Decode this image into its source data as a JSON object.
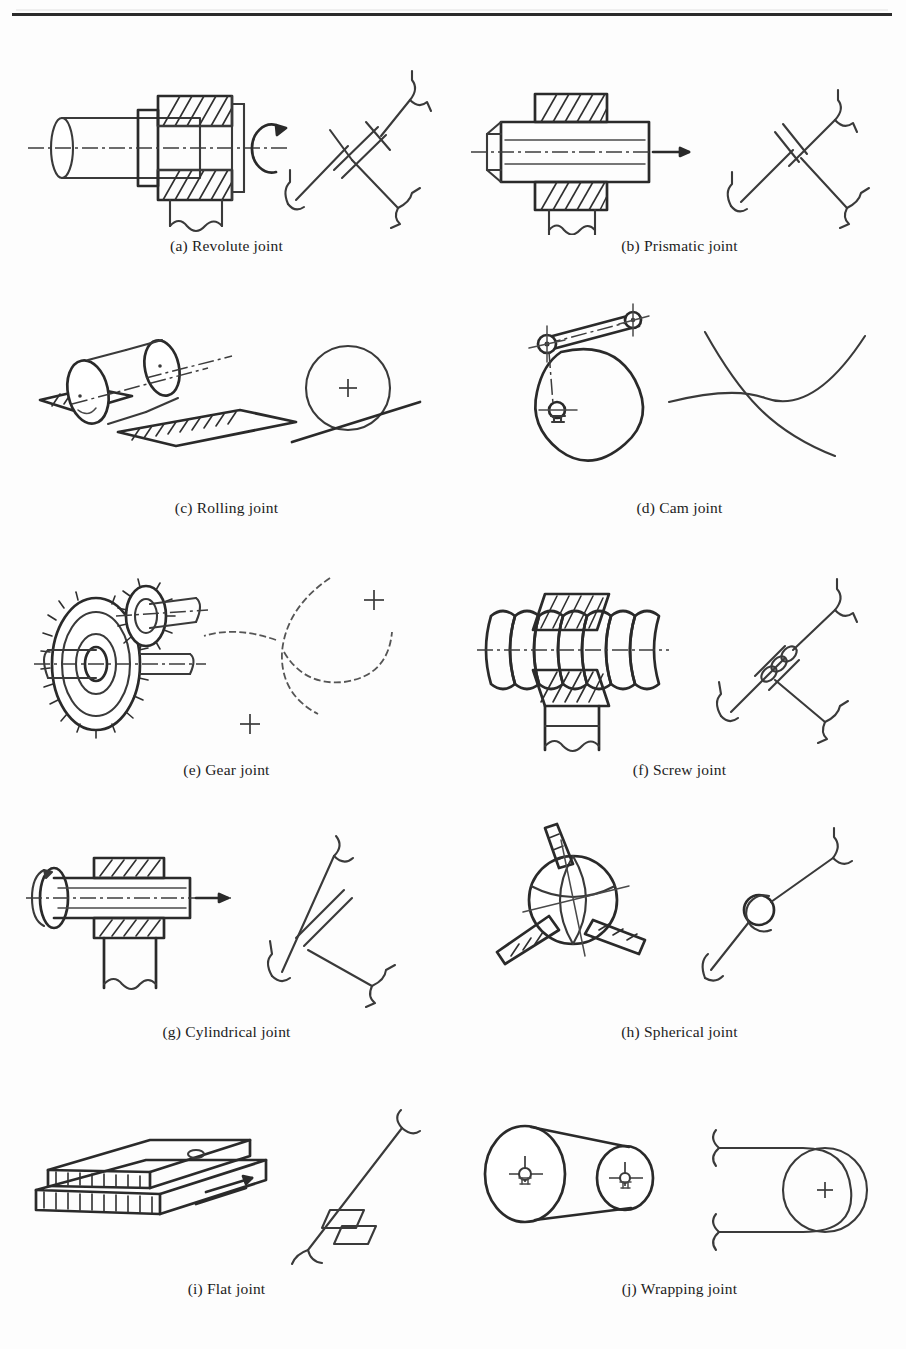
{
  "figure": {
    "has_top_rule": true,
    "column_count": 2,
    "row_count": 5,
    "ink_color": "#3a3a3a",
    "background_color": "#fdfdfd"
  },
  "items": [
    {
      "key": "a",
      "label": "(a) Revolute joint",
      "letter": "(a)",
      "name": "Revolute joint",
      "pictorial": "shaft-in-hatched-bearing-block-with-rotation-arrow",
      "symbol": "two-links-with-pin-joint-and-cross-hatch-ground-hooks",
      "dof": "1 rotational"
    },
    {
      "key": "b",
      "label": "(b) Prismatic joint",
      "letter": "(b)",
      "name": "Prismatic joint",
      "pictorial": "square-slider-bar-through-hatched-guide-block-with-translation-arrow",
      "symbol": "two-links-with-sliding-pair-and-ground-hooks",
      "dof": "1 translational"
    },
    {
      "key": "c",
      "label": "(c) Rolling joint",
      "letter": "(c)",
      "name": "Rolling joint",
      "pictorial": "roller-wheels-on-hatched-flat-rails",
      "symbol": "circle-tangent-to-inclined-line-with-center-cross",
      "dof": "rolling contact"
    },
    {
      "key": "d",
      "label": "(d) Cam joint",
      "letter": "(d)",
      "name": "Cam joint",
      "pictorial": "cam-disc-with-pivoted-follower-arm-and-center-marks",
      "symbol": "two-tangent-curves-higher-pair-contact",
      "dof": "higher pair contact"
    },
    {
      "key": "e",
      "label": "(e) Gear joint",
      "letter": "(e)",
      "name": "Gear joint",
      "pictorial": "two-meshing-spur-gears-on-shafts",
      "symbol": "two-tangent-dashed-pitch-circles-with-center-crosses",
      "dof": "meshing rotation"
    },
    {
      "key": "f",
      "label": "(f) Screw joint",
      "letter": "(f)",
      "name": "Screw joint",
      "pictorial": "threaded-screw-shaft-in-hatched-nut-block",
      "symbol": "two-links-with-helical-thread-pair-and-ground-hooks",
      "dof": "1 helical"
    },
    {
      "key": "g",
      "label": "(g) Cylindrical joint",
      "letter": "(g)",
      "name": "Cylindrical joint",
      "pictorial": "shaft-with-flange-sliding-and-rotating-in-hatched-sleeve",
      "symbol": "two-links-with-combined-sliding-and-turning-pair",
      "dof": "2 (rotation + translation)"
    },
    {
      "key": "h",
      "label": "(h) Spherical joint",
      "letter": "(h)",
      "name": "Spherical joint",
      "pictorial": "ball-with-three-radial-rods-socket",
      "symbol": "two-links-joined-by-small-circle-ball-socket",
      "dof": "3 rotational"
    },
    {
      "key": "i",
      "label": "(i) Flat joint",
      "letter": "(i)",
      "name": "Flat joint",
      "pictorial": "flat-plate-sliding-on-hatched-flat-plate",
      "symbol": "two-links-with-planar-pair-rectangles",
      "dof": "3 planar"
    },
    {
      "key": "j",
      "label": "(j) Wrapping joint",
      "letter": "(j)",
      "name": "Wrapping joint",
      "pictorial": "belt-wrapped-around-two-pulleys-with-center-marks",
      "symbol": "belt-wrapping-around-pulley-circle-with-center-cross",
      "dof": "wrapping contact"
    }
  ]
}
